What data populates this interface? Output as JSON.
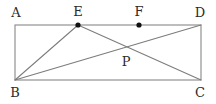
{
  "figure": {
    "kind": "geometry-diagram",
    "canvas": {
      "width": 216,
      "height": 104
    },
    "colors": {
      "background": "#ffffff",
      "rectangle_stroke": "#8d8d8d",
      "segment_stroke": "#7c7c7c",
      "dot_fill": "#111111",
      "label_text": "#2b2b2b"
    },
    "points": [
      {
        "id": "A",
        "label": "A",
        "x": 15,
        "y": 25,
        "dot": false,
        "label_x": 16,
        "label_y": 17
      },
      {
        "id": "E",
        "label": "E",
        "x": 78,
        "y": 25,
        "dot": true,
        "label_x": 78,
        "label_y": 16
      },
      {
        "id": "F",
        "label": "F",
        "x": 139,
        "y": 25,
        "dot": true,
        "label_x": 139,
        "label_y": 16
      },
      {
        "id": "D",
        "label": "D",
        "x": 201,
        "y": 25,
        "dot": false,
        "label_x": 200,
        "label_y": 17
      },
      {
        "id": "B",
        "label": "B",
        "x": 15,
        "y": 80,
        "dot": false,
        "label_x": 15,
        "label_y": 97
      },
      {
        "id": "C",
        "label": "C",
        "x": 201,
        "y": 80,
        "dot": false,
        "label_x": 200,
        "label_y": 97
      },
      {
        "id": "P",
        "label": "P",
        "x": 125,
        "y": 50,
        "dot": false,
        "label_x": 126,
        "label_y": 66
      }
    ],
    "rectangle": {
      "from": "A",
      "to": "C",
      "vertices": [
        "A",
        "D",
        "C",
        "B"
      ]
    },
    "segments": [
      {
        "id": "BE",
        "from": "B",
        "to": "E"
      },
      {
        "id": "BD",
        "from": "B",
        "to": "D"
      },
      {
        "id": "EC",
        "from": "E",
        "to": "C"
      }
    ],
    "labels_text": {
      "A": "A",
      "B": "B",
      "C": "C",
      "D": "D",
      "E": "E",
      "F": "F",
      "P": "P"
    }
  }
}
